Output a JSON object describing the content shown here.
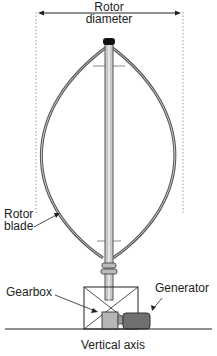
{
  "diagram": {
    "labels": {
      "rotor_diameter_line1": "Rotor",
      "rotor_diameter_line2": "diameter",
      "rotor_blade_line1": "Rotor",
      "rotor_blade_line2": "blade",
      "gearbox": "Gearbox",
      "generator": "Generator",
      "vertical_axis": "Vertical axis"
    },
    "colors": {
      "line": "#222222",
      "blade": "#666666",
      "generator": "#707070",
      "shaft": "#b0b0b0"
    }
  }
}
